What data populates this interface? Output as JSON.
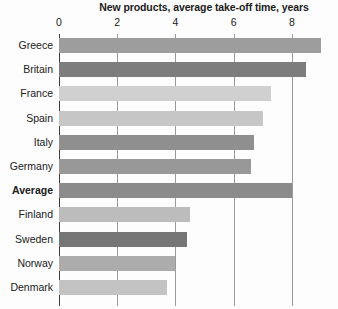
{
  "chart_data": {
    "type": "bar",
    "orientation": "horizontal",
    "title": "New products, average take-off time, years",
    "xlabel": "",
    "ylabel": "",
    "xlim": [
      0,
      9.6
    ],
    "grid": true,
    "legend": false,
    "tick_labels": [
      "0",
      "2",
      "4",
      "6",
      "8"
    ],
    "ticks": [
      0,
      2,
      4,
      6,
      8
    ],
    "categories": [
      "Greece",
      "Britain",
      "France",
      "Spain",
      "Italy",
      "Germany",
      "Average",
      "Finland",
      "Sweden",
      "Norway",
      "Denmark"
    ],
    "values": [
      9.0,
      8.5,
      7.3,
      7.0,
      6.7,
      6.6,
      8.0,
      4.5,
      4.4,
      4.0,
      3.7
    ],
    "bar_colors": [
      "#9d9d9d",
      "#7d7d7d",
      "#d0d0d0",
      "#c6c6c6",
      "#8f8f8f",
      "#989898",
      "#8b8b8b",
      "#bcbcbc",
      "#767676",
      "#acacac",
      "#c3c3c3"
    ],
    "emphasized_category": "Average"
  },
  "colors": {
    "background": "#fdfdfd",
    "title_text": "#1b1b1b",
    "label_text": "#202020",
    "gridline": "#9a9a9a",
    "axis": "#3d3d3d"
  }
}
